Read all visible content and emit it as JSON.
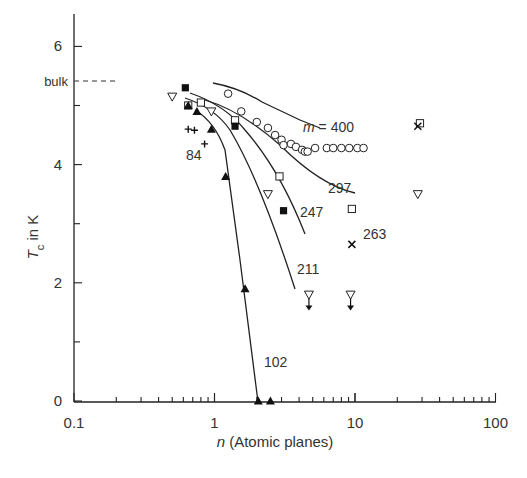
{
  "chart_data": {
    "type": "scatter",
    "title": "",
    "xlabel": "n (Atomic planes)",
    "xlabel_italic": "n",
    "xlabel_rest": " (Atomic planes)",
    "ylabel": "Tc in K",
    "ylabel_main": "T",
    "ylabel_sub": "c",
    "ylabel_rest": " in K",
    "xscale": "log",
    "xlim": [
      0.1,
      100
    ],
    "ylim": [
      0,
      6.6
    ],
    "x_ticks": [
      "0.1",
      "1",
      "10",
      "100"
    ],
    "y_ticks": [
      "0",
      "2",
      "4",
      "6"
    ],
    "bulk_label": "bulk",
    "bulk_value": 5.4,
    "grid": false,
    "legend": "none (curves labelled inline by m value)",
    "series": [
      {
        "name": "m = 400",
        "label": "m = 400",
        "marker": "open-circle",
        "curve": true,
        "points": [
          [
            1.25,
            5.2
          ],
          [
            1.55,
            4.9
          ],
          [
            2.0,
            4.72
          ],
          [
            2.4,
            4.62
          ],
          [
            2.7,
            4.5
          ],
          [
            3.0,
            4.42
          ],
          [
            3.1,
            4.33
          ],
          [
            3.5,
            4.35
          ],
          [
            3.8,
            4.3
          ],
          [
            4.2,
            4.25
          ],
          [
            4.4,
            4.22
          ],
          [
            4.6,
            4.22
          ],
          [
            5.2,
            4.28
          ],
          [
            6.3,
            4.28
          ],
          [
            7.0,
            4.28
          ],
          [
            8.0,
            4.28
          ],
          [
            9.1,
            4.28
          ],
          [
            10.4,
            4.28
          ],
          [
            11.5,
            4.28
          ]
        ]
      },
      {
        "name": "m = 297",
        "label": "297",
        "marker": "open-square",
        "curve": true,
        "points": [
          [
            0.65,
            5.0
          ],
          [
            0.8,
            5.05
          ],
          [
            1.4,
            4.75
          ],
          [
            2.9,
            3.8
          ],
          [
            9.5,
            3.25
          ],
          [
            29.0,
            4.7
          ]
        ]
      },
      {
        "name": "m = 247",
        "label": "247",
        "marker": "filled-square",
        "curve": true,
        "points": [
          [
            0.62,
            5.3
          ],
          [
            1.4,
            4.65
          ],
          [
            3.1,
            3.22
          ]
        ]
      },
      {
        "name": "m = 211",
        "label": "211",
        "marker": "open-triangle-down",
        "curve": true,
        "points": [
          [
            0.5,
            5.15
          ],
          [
            0.95,
            4.9
          ],
          [
            2.4,
            3.5
          ],
          [
            4.7,
            "<1.8"
          ],
          [
            9.3,
            "<1.8"
          ],
          [
            28.0,
            3.5
          ]
        ]
      },
      {
        "name": "m = 102",
        "label": "102",
        "marker": "filled-triangle-up",
        "curve": true,
        "points": [
          [
            0.65,
            5.0
          ],
          [
            0.75,
            4.9
          ],
          [
            0.95,
            4.6
          ],
          [
            1.2,
            3.8
          ],
          [
            1.65,
            1.9
          ],
          [
            2.05,
            0
          ],
          [
            2.5,
            0
          ]
        ]
      },
      {
        "name": "m = 263",
        "label": "263",
        "marker": "cross-x",
        "curve": false,
        "points": [
          [
            9.5,
            2.65
          ],
          [
            28.0,
            4.65
          ]
        ]
      },
      {
        "name": "m = 84",
        "label": "84",
        "marker": "plus",
        "curve": false,
        "points": [
          [
            0.65,
            4.6
          ],
          [
            0.72,
            4.58
          ],
          [
            0.85,
            4.35
          ]
        ]
      }
    ]
  }
}
